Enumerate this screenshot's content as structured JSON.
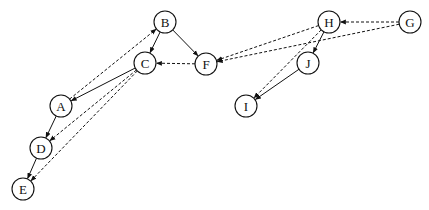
{
  "diagram": {
    "type": "directed-graph",
    "node_radius": 11,
    "nodes": [
      {
        "id": "A",
        "label": "A",
        "x": 61,
        "y": 106
      },
      {
        "id": "B",
        "label": "B",
        "x": 165,
        "y": 22
      },
      {
        "id": "C",
        "label": "C",
        "x": 145,
        "y": 63
      },
      {
        "id": "D",
        "label": "D",
        "x": 41,
        "y": 148
      },
      {
        "id": "E",
        "label": "E",
        "x": 23,
        "y": 189
      },
      {
        "id": "F",
        "label": "F",
        "x": 206,
        "y": 64
      },
      {
        "id": "G",
        "label": "G",
        "x": 410,
        "y": 22
      },
      {
        "id": "H",
        "label": "H",
        "x": 329,
        "y": 22
      },
      {
        "id": "I",
        "label": "I",
        "x": 246,
        "y": 106
      },
      {
        "id": "J",
        "label": "J",
        "x": 308,
        "y": 63
      }
    ],
    "edges": [
      {
        "from": "B",
        "to": "C",
        "style": "solid"
      },
      {
        "from": "B",
        "to": "F",
        "style": "solid"
      },
      {
        "from": "C",
        "to": "A",
        "style": "solid"
      },
      {
        "from": "A",
        "to": "D",
        "style": "solid"
      },
      {
        "from": "D",
        "to": "E",
        "style": "solid"
      },
      {
        "from": "A",
        "to": "B",
        "style": "dashed"
      },
      {
        "from": "F",
        "to": "C",
        "style": "dashed"
      },
      {
        "from": "C",
        "to": "D",
        "style": "dashed"
      },
      {
        "from": "C",
        "to": "E",
        "style": "dashed"
      },
      {
        "from": "H",
        "to": "J",
        "style": "solid"
      },
      {
        "from": "J",
        "to": "I",
        "style": "solid"
      },
      {
        "from": "G",
        "to": "H",
        "style": "dashed"
      },
      {
        "from": "G",
        "to": "F",
        "style": "dashed"
      },
      {
        "from": "H",
        "to": "F",
        "style": "dashed"
      },
      {
        "from": "H",
        "to": "I",
        "style": "dashed"
      }
    ]
  }
}
